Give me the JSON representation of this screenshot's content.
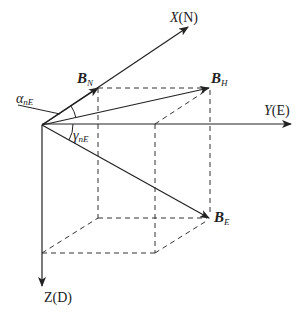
{
  "diagram": {
    "title": "",
    "colors": {
      "line": "#222222",
      "dashed": "#333333",
      "background": "#ffffff"
    },
    "axes": {
      "x": {
        "label_var": "X",
        "label_dir": "(N)"
      },
      "y": {
        "label_var": "Y",
        "label_dir": "(E)"
      },
      "z": {
        "label_var": "Z",
        "label_dir": "(D)"
      }
    },
    "vectors": {
      "bn": {
        "main": "B",
        "sub": "N"
      },
      "bh": {
        "main": "B",
        "sub": "H"
      },
      "be": {
        "main": "B",
        "sub": "E"
      }
    },
    "angles": {
      "alpha": {
        "main": "α",
        "sub": "nE"
      },
      "gamma": {
        "main": "γ",
        "sub": "nE"
      }
    }
  }
}
